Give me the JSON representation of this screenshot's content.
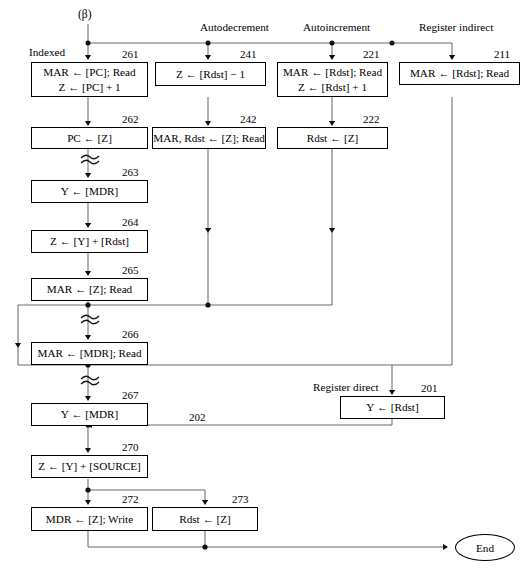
{
  "diagram": {
    "title_symbol": "(β)",
    "end_label": "End",
    "mode_labels": {
      "indexed": "Indexed",
      "autodecrement": "Autodecrement",
      "autoincrement": "Autoincrement",
      "register_indirect": "Register indirect",
      "register_direct": "Register direct"
    },
    "nodes": [
      {
        "id": "261",
        "tag": "261",
        "lines": [
          "MAR ← [PC]; Read",
          "Z ← [PC] + 1"
        ]
      },
      {
        "id": "262",
        "tag": "262",
        "lines": [
          "PC ← [Z]"
        ]
      },
      {
        "id": "263",
        "tag": "263",
        "lines": [
          "Y ← [MDR]"
        ]
      },
      {
        "id": "264",
        "tag": "264",
        "lines": [
          "Z ← [Y] + [Rdst]"
        ]
      },
      {
        "id": "265",
        "tag": "265",
        "lines": [
          "MAR ← [Z]; Read"
        ]
      },
      {
        "id": "266",
        "tag": "266",
        "lines": [
          "MAR ← [MDR]; Read"
        ]
      },
      {
        "id": "267",
        "tag": "267",
        "lines": [
          "Y ← [MDR]"
        ]
      },
      {
        "id": "270",
        "tag": "270",
        "lines": [
          "Z ← [Y] + [SOURCE]"
        ]
      },
      {
        "id": "272",
        "tag": "272",
        "lines": [
          "MDR ← [Z]; Write"
        ]
      },
      {
        "id": "273",
        "tag": "273",
        "lines": [
          "Rdst ← [Z]"
        ]
      },
      {
        "id": "241",
        "tag": "241",
        "lines": [
          "Z ← [Rdst] − 1"
        ]
      },
      {
        "id": "242",
        "tag": "242",
        "lines": [
          "MAR, Rdst ← [Z]; Read"
        ]
      },
      {
        "id": "221",
        "tag": "221",
        "lines": [
          "MAR ← [Rdst]; Read",
          "Z ← [Rdst] + 1"
        ]
      },
      {
        "id": "222",
        "tag": "222",
        "lines": [
          "Rdst ← [Z]"
        ]
      },
      {
        "id": "211",
        "tag": "211",
        "lines": [
          "MAR ← [Rdst]; Read"
        ]
      },
      {
        "id": "201",
        "tag": "201",
        "lines": [
          "Y ← [Rdst]"
        ]
      }
    ],
    "edge_tags": [
      {
        "id": "202",
        "label": "202"
      }
    ],
    "colors": {
      "line": "#6b6b6b",
      "box_border": "#000000",
      "text": "#000000",
      "background": "#ffffff"
    }
  }
}
